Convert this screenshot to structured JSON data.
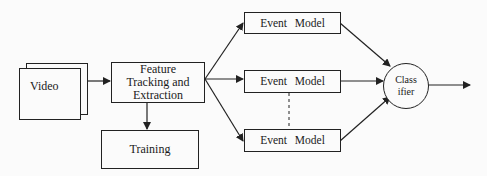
{
  "diagram": {
    "nodes": {
      "video": {
        "label": "Video"
      },
      "feature": {
        "lines": [
          "Feature",
          "Tracking and",
          "Extraction"
        ]
      },
      "training": {
        "label": "Training"
      },
      "event_models": [
        {
          "label": "Event Model"
        },
        {
          "label": "Event Model"
        },
        {
          "label": "Event Model"
        }
      ],
      "classifier": {
        "lines": [
          "Class",
          "ifier"
        ]
      }
    },
    "edges": [
      {
        "from": "video",
        "to": "feature"
      },
      {
        "from": "feature",
        "to": "training"
      },
      {
        "from": "feature",
        "to": "event_model_1"
      },
      {
        "from": "feature",
        "to": "event_model_2"
      },
      {
        "from": "feature",
        "to": "event_model_3"
      },
      {
        "from": "event_model_1",
        "to": "classifier"
      },
      {
        "from": "event_model_2",
        "to": "classifier"
      },
      {
        "from": "event_model_3",
        "to": "classifier"
      },
      {
        "from": "classifier",
        "to": "output"
      }
    ],
    "colors": {
      "stroke": "#222222",
      "background": "#fbfbfb"
    }
  }
}
